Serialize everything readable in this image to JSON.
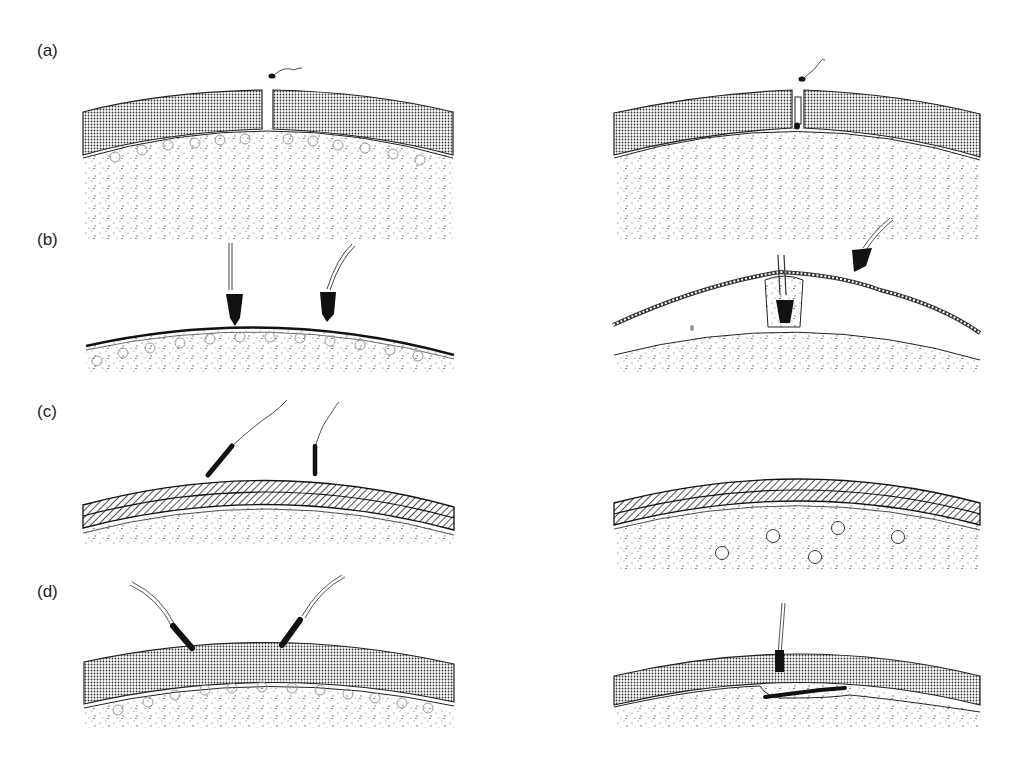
{
  "figure": {
    "rows": [
      {
        "label": "(a)",
        "description": "Zona pellucida with slit; sperm penetrating through the slit"
      },
      {
        "label": "(b)",
        "description": "Sperm attached to vitelline surface; acrosome reaction with fertilization cone"
      },
      {
        "label": "(c)",
        "description": "Sperm on hatched chorion layer; egg with cortical granules"
      },
      {
        "label": "(d)",
        "description": "Sperm penetrating zona; sperm incorporation into egg cytoplasm"
      }
    ]
  },
  "colors": {
    "ink": "#1a1a1a",
    "paper": "#ffffff",
    "stipple": "#555555"
  }
}
